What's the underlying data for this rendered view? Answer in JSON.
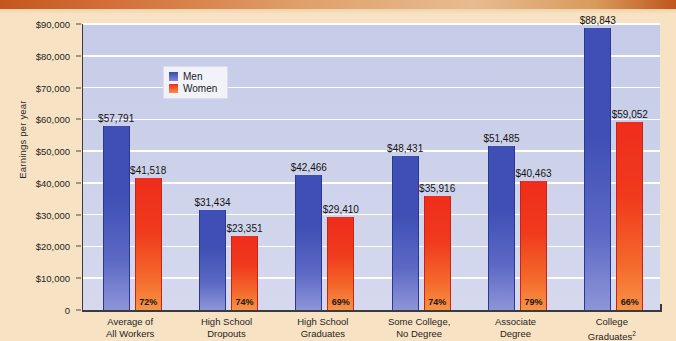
{
  "top_band": {
    "cut_off_text": ""
  },
  "legend": {
    "position": "inside-top-left",
    "entries": [
      {
        "label": "Men",
        "color": "#3f4fb5"
      },
      {
        "label": "Women",
        "color": "#ef2d1c"
      }
    ]
  },
  "axis": {
    "ylabel": "Earnings per year",
    "yticks": [
      "$90,000",
      "$80,000",
      "$70,000",
      "$60,000",
      "$50,000",
      "$40,000",
      "$30,000",
      "$20,000",
      "$10,000",
      "0"
    ]
  },
  "colors": {
    "page_background": "#f7e3c4",
    "plot_background": "#ccd1ea",
    "gridline": "#ffffff",
    "men": "#3f4fb5",
    "women": "#ef2d1c",
    "axis": "#3b3b3b",
    "band": "#c4571e"
  },
  "chart_data": {
    "type": "bar",
    "title": "",
    "xlabel": "",
    "ylabel": "Earnings per year",
    "ylim": [
      0,
      90000
    ],
    "ytick_values": [
      0,
      10000,
      20000,
      30000,
      40000,
      50000,
      60000,
      70000,
      80000,
      90000
    ],
    "grid": true,
    "legend_position": "inside-top-left",
    "categories": [
      "Average of All Workers",
      "High School Dropouts",
      "High School Graduates",
      "Some College, No Degree",
      "Associate Degree",
      "College Graduates²"
    ],
    "category_lines": [
      [
        "Average of",
        "All Workers"
      ],
      [
        "High School",
        "Dropouts"
      ],
      [
        "High School",
        "Graduates"
      ],
      [
        "Some College,",
        "No Degree"
      ],
      [
        "Associate",
        "Degree"
      ],
      [
        "College",
        "Graduates",
        "2"
      ]
    ],
    "series": [
      {
        "name": "Men",
        "color": "#3f4fb5",
        "values": [
          57791,
          31434,
          42466,
          48431,
          51485,
          88843
        ],
        "labels": [
          "$57,791",
          "$31,434",
          "$42,466",
          "$48,431",
          "$51,485",
          "$88,843"
        ]
      },
      {
        "name": "Women",
        "color": "#ef2d1c",
        "values": [
          41518,
          23351,
          29410,
          35916,
          40463,
          59052
        ],
        "labels": [
          "$41,518",
          "$23,351",
          "$29,410",
          "$35,916",
          "$40,463",
          "$59,052"
        ],
        "ratio_labels": [
          "72%",
          "74%",
          "69%",
          "74%",
          "79%",
          "66%"
        ]
      }
    ]
  }
}
